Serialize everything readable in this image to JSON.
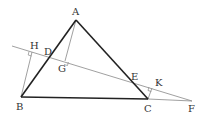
{
  "diagram": {
    "type": "geometry",
    "points": {
      "A": {
        "label": "A",
        "x": 76,
        "y": 20
      },
      "B": {
        "label": "B",
        "x": 21,
        "y": 97
      },
      "C": {
        "label": "C",
        "x": 148,
        "y": 99
      },
      "D": {
        "label": "D",
        "x": 49,
        "y": 58
      },
      "E": {
        "label": "E",
        "x": 132,
        "y": 82
      },
      "F": {
        "label": "F",
        "x": 192,
        "y": 101
      },
      "G": {
        "label": "G",
        "x": 65,
        "y": 62
      },
      "H": {
        "label": "H",
        "x": 32,
        "y": 53
      },
      "K": {
        "label": "K",
        "x": 152,
        "y": 88
      }
    },
    "segments": [
      {
        "from": "A",
        "to": "B",
        "style": "thick"
      },
      {
        "from": "A",
        "to": "C",
        "style": "thick"
      },
      {
        "from": "B",
        "to": "C",
        "style": "thick"
      },
      {
        "from": "C",
        "to": "F",
        "style": "thin"
      },
      {
        "from": "line-start",
        "to": "F",
        "style": "thin"
      },
      {
        "from": "B",
        "to": "H",
        "style": "thin"
      },
      {
        "from": "A",
        "to": "G",
        "style": "thin"
      },
      {
        "from": "C",
        "to": "K",
        "style": "thin"
      }
    ],
    "right_angles": [
      "H",
      "G",
      "K"
    ]
  }
}
